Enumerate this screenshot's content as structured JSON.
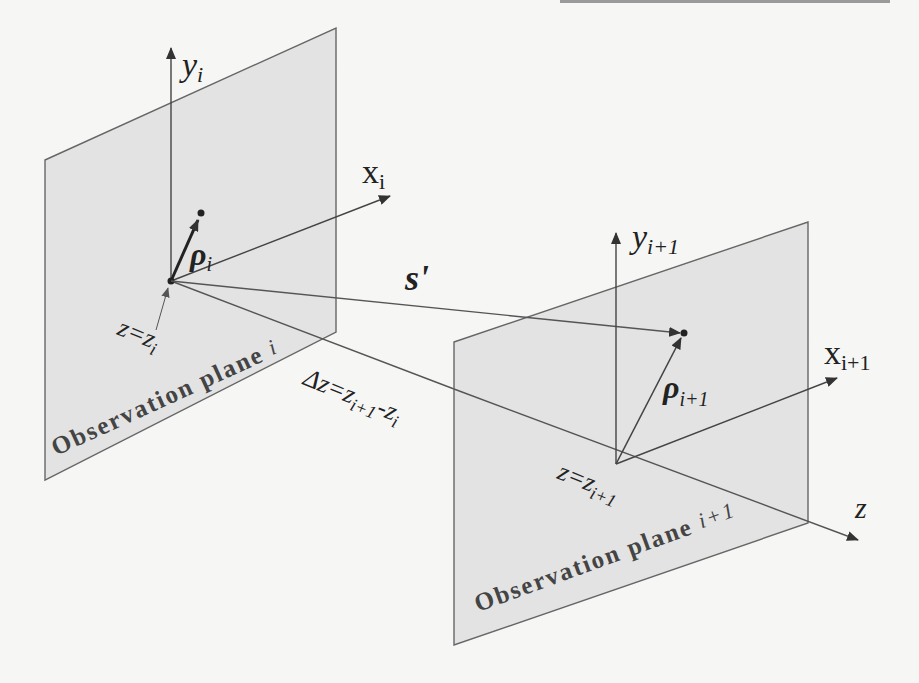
{
  "diagram": {
    "type": "geometric-optics-schematic",
    "colors": {
      "background": "#f6f6f5",
      "plane_fill": "#e2e2e2",
      "line": "#555555",
      "text": "#222222",
      "bold_text": "#333333"
    },
    "planes": [
      {
        "id": "plane-i",
        "label": "Observation plane",
        "index": "i",
        "corners": [
          [
            45,
            160
          ],
          [
            336,
            28
          ],
          [
            336,
            332
          ],
          [
            45,
            480
          ]
        ],
        "origin": [
          171,
          281
        ],
        "y_axis": {
          "label": "y",
          "sub": "i",
          "end": [
            171,
            48
          ]
        },
        "x_axis": {
          "label": "x",
          "sub": "i",
          "end": [
            390,
            196
          ]
        },
        "rho": {
          "label": "ρ",
          "sub": "i",
          "end": [
            201,
            213
          ]
        },
        "z_label": {
          "text": "z=z",
          "sub": "i"
        }
      },
      {
        "id": "plane-i1",
        "label": "Observation plane",
        "index": "i+1",
        "corners": [
          [
            454,
            342
          ],
          [
            808,
            222
          ],
          [
            808,
            523
          ],
          [
            454,
            645
          ]
        ],
        "origin": [
          616,
          464
        ],
        "y_axis": {
          "label": "y",
          "sub": "i+1",
          "end": [
            616,
            233
          ]
        },
        "x_axis": {
          "label": "x",
          "sub": "i+1",
          "end": [
            837,
            378
          ]
        },
        "rho": {
          "label": "ρ",
          "sub": "i+1",
          "end": [
            683,
            333
          ]
        },
        "z_label": {
          "text": "z=z",
          "sub": "i+1"
        }
      }
    ],
    "propagation_vector": {
      "label": "s'",
      "from": [
        171,
        281
      ],
      "to": [
        683,
        333
      ]
    },
    "z_axis": {
      "label": "z",
      "from": [
        171,
        281
      ],
      "to": [
        860,
        540
      ]
    },
    "delta_z": {
      "text": "Δz=z",
      "sub1": "i+1",
      "mid": "-z",
      "sub2": "i"
    }
  }
}
